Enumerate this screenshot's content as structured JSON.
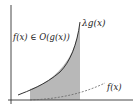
{
  "diagram": {
    "labels": {
      "upper_curve": "λg(x)",
      "relation": "f(x) ∈ O(g(x))",
      "lower_curve": "f(x)"
    },
    "colors": {
      "axis": "#333333",
      "curve": "#333333",
      "shade": "#b8b8b8",
      "dashed": "#666666"
    }
  }
}
